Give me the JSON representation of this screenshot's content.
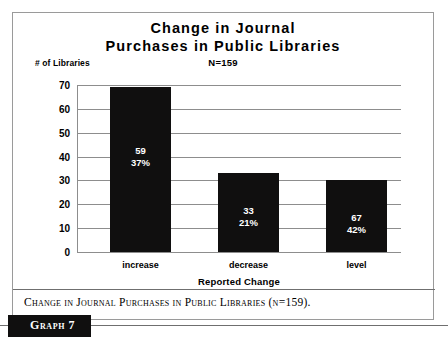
{
  "chart_data": {
    "type": "bar",
    "title": "Change in Journal Purchases in Public Libraries",
    "title_lines": [
      "Change in Journal",
      "Purchases in Public Libraries"
    ],
    "subtitle": "N=159",
    "xlabel": "Reported Change",
    "ylabel": "# of Libraries",
    "categories": [
      "increase",
      "decrease",
      "level"
    ],
    "values": [
      69,
      33,
      30
    ],
    "data_labels": [
      {
        "count": "59",
        "percent": "37%"
      },
      {
        "count": "33",
        "percent": "21%"
      },
      {
        "count": "67",
        "percent": "42%"
      }
    ],
    "ylim": [
      0,
      70
    ],
    "yticks": [
      "0",
      "10",
      "20",
      "30",
      "40",
      "50",
      "60",
      "70"
    ],
    "grid": true,
    "legend": "none",
    "bar_color": "#100f0f",
    "grid_color": "#8d8d8d",
    "label_color": "#ffffff"
  },
  "caption": {
    "text": "Change in Journal Purchases in Public Libraries (n=159).",
    "badge": "Graph 7"
  }
}
